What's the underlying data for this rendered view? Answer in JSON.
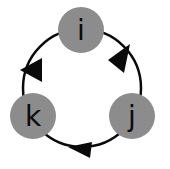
{
  "diagram": {
    "type": "cycle",
    "colors": {
      "node_fill": "#8c8c8c",
      "edge": "#0a0a0a",
      "arrow": "#0a0a0a",
      "label": "#0b0b0b",
      "background": "#ffffff"
    },
    "nodes": [
      {
        "id": "i",
        "label": "i",
        "cx": 81,
        "cy": 30,
        "r": 23
      },
      {
        "id": "j",
        "label": "j",
        "cx": 132,
        "cy": 116,
        "r": 23
      },
      {
        "id": "k",
        "label": "k",
        "cx": 33,
        "cy": 116,
        "r": 23
      }
    ],
    "edges": [
      {
        "from": "i",
        "to": "j",
        "direction": "clockwise"
      },
      {
        "from": "j",
        "to": "k",
        "direction": "clockwise"
      },
      {
        "from": "k",
        "to": "i",
        "direction": "clockwise"
      }
    ]
  }
}
